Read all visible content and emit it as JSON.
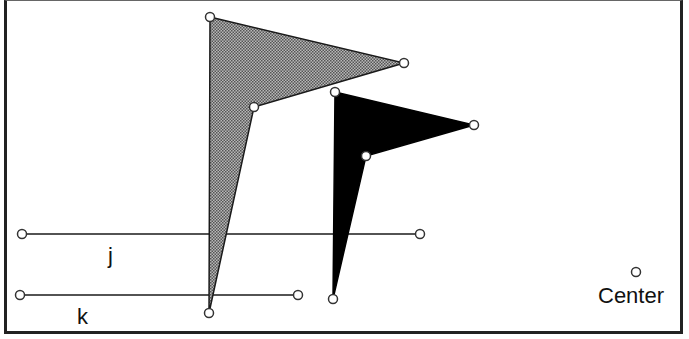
{
  "labels": {
    "line_j": "j",
    "line_k": "k",
    "center": "Center"
  },
  "colors": {
    "stroke": "#1a1a1a",
    "gray_fill": "#8a8a8a",
    "black_fill": "#000000",
    "handle_fill": "#ffffff"
  },
  "shapes": {
    "gray_arrow": {
      "points": [
        [
          210,
          17
        ],
        [
          404,
          63
        ],
        [
          254,
          107
        ],
        [
          209,
          313
        ]
      ],
      "fill": "checkered gray"
    },
    "black_arrow": {
      "points": [
        [
          335,
          92
        ],
        [
          474,
          125
        ],
        [
          366,
          156
        ],
        [
          333,
          299
        ]
      ],
      "fill": "solid black"
    },
    "line_j": {
      "from": [
        22,
        234
      ],
      "to": [
        420,
        234
      ]
    },
    "line_k": {
      "from": [
        20,
        295
      ],
      "to": [
        298,
        295
      ]
    },
    "center_point": [
      636,
      272
    ]
  }
}
